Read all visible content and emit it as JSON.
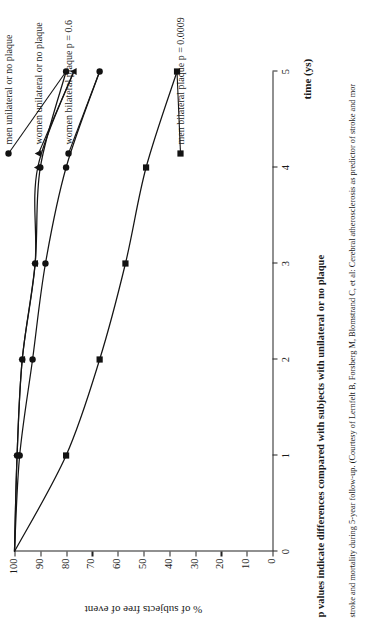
{
  "figure": {
    "caption_bold": "p values indicate differences compared with subjects with unilateral or no plaque",
    "caption_source": "stroke and mortality during 5-year follow-up. (Courtesy of Lernfelt B, Forsberg M, Blomstrand C, et al: Cerebral atherosclerosis as predictor of stroke and mor"
  },
  "chart_data": {
    "type": "line",
    "title": "",
    "xlabel": "time (ys)",
    "ylabel": "% of subjects free of event",
    "xlim": [
      0,
      5
    ],
    "ylim": [
      0,
      100
    ],
    "xticks": [
      "0",
      "1",
      "2",
      "3",
      "4",
      "5"
    ],
    "yticks": [
      "0",
      "10",
      "20",
      "30",
      "40",
      "50",
      "60",
      "70",
      "80",
      "90",
      "100"
    ],
    "grid": false,
    "legend_position": "inline-end-labels",
    "x": [
      0,
      1,
      2,
      3,
      4,
      5
    ],
    "series": [
      {
        "name": "men unilateral or no plaque",
        "label": "men unilateral or no plaque",
        "marker": "circle",
        "values": [
          100,
          99,
          97,
          92,
          90,
          80
        ]
      },
      {
        "name": "women unilateral or no plaque",
        "label": "women unilateral or no plaque",
        "marker": "triangle",
        "values": [
          100,
          99,
          97,
          92,
          91,
          77
        ]
      },
      {
        "name": "women bilateral plaque p = 0.6",
        "label": "women bilateral plaque  p = 0.6",
        "marker": "circle",
        "values": [
          100,
          98,
          93,
          88,
          80,
          67
        ]
      },
      {
        "name": "men bilateral plaque p = 0.0009",
        "label": "men bilateral plaque  p = 0.0009",
        "marker": "square",
        "values": [
          100,
          80,
          67,
          57,
          49,
          37
        ]
      }
    ]
  }
}
